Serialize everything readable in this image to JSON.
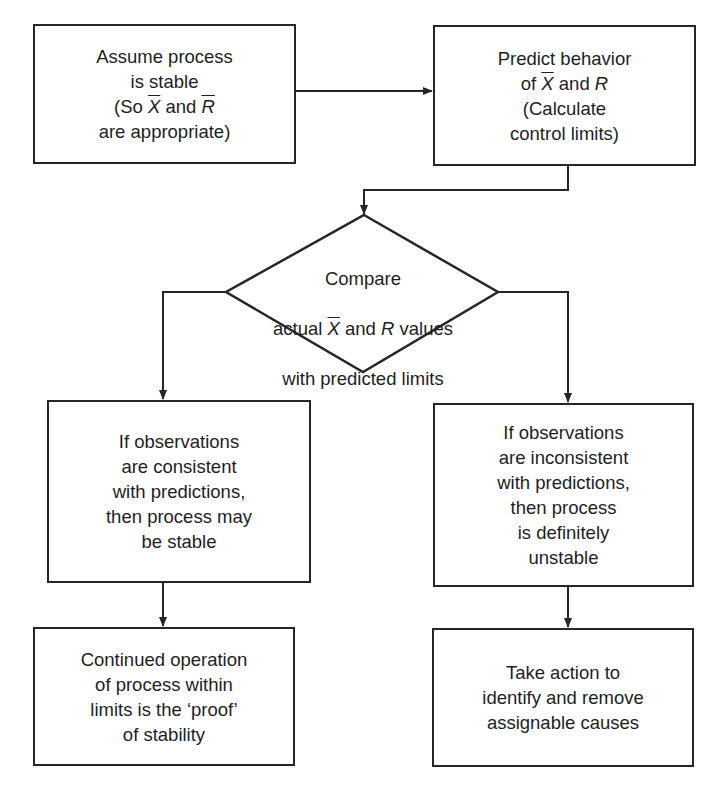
{
  "diagram": {
    "type": "flowchart",
    "title": "",
    "nodes": [
      {
        "id": "n1",
        "shape": "rect",
        "lines": [
          "Assume process",
          "is stable",
          "(So X̅ and R̅",
          "are appropriate)"
        ]
      },
      {
        "id": "n2",
        "shape": "rect",
        "lines": [
          "Predict behavior",
          "of X̅ and R",
          "(Calculate",
          "control limits)"
        ]
      },
      {
        "id": "n3",
        "shape": "diamond",
        "lines": [
          "Compare",
          "actual X̅ and R values",
          "with predicted limits"
        ]
      },
      {
        "id": "n4",
        "shape": "rect",
        "lines": [
          "If observations",
          "are consistent",
          "with predictions,",
          "then process may",
          "be stable"
        ]
      },
      {
        "id": "n5",
        "shape": "rect",
        "lines": [
          "If observations",
          "are inconsistent",
          "with predictions,",
          "then process",
          "is definitely",
          "unstable"
        ]
      },
      {
        "id": "n6",
        "shape": "rect",
        "lines": [
          "Continued operation",
          "of process within",
          "limits is the ‘proof’",
          "of stability"
        ]
      },
      {
        "id": "n7",
        "shape": "rect",
        "lines": [
          "Take action to",
          "identify and remove",
          "assignable causes"
        ]
      }
    ],
    "edges": [
      {
        "from": "n1",
        "to": "n2"
      },
      {
        "from": "n2",
        "to": "n3"
      },
      {
        "from": "n3",
        "to": "n4"
      },
      {
        "from": "n3",
        "to": "n5"
      },
      {
        "from": "n4",
        "to": "n6"
      },
      {
        "from": "n5",
        "to": "n7"
      }
    ],
    "colors": {
      "stroke": "#262626",
      "text": "#1e1e1e",
      "background": "#ffffff"
    }
  },
  "text": {
    "n1": {
      "l1": "Assume process",
      "l2": "is stable",
      "l3a": "(So ",
      "l3x": "X",
      "l3b": " and ",
      "l3r": "R",
      "l3c": "",
      "l4": "are appropriate)"
    },
    "n2": {
      "l1": "Predict behavior",
      "l2a": "of ",
      "l2x": "X",
      "l2b": " and ",
      "l2r": "R",
      "l3": "(Calculate",
      "l4": "control limits)"
    },
    "n3": {
      "l1": "Compare",
      "l2a": "actual ",
      "l2x": "X",
      "l2b": " and ",
      "l2r": "R",
      "l2c": " values",
      "l3": "with predicted limits"
    },
    "n4": {
      "label": "If observations\nare consistent\nwith predictions,\nthen process may\nbe stable"
    },
    "n5": {
      "label": "If observations\nare inconsistent\nwith predictions,\nthen process\nis definitely\nunstable"
    },
    "n6": {
      "label": "Continued operation\nof process within\nlimits is the ‘proof’\nof stability"
    },
    "n7": {
      "label": "Take action to\nidentify and remove\nassignable causes"
    }
  }
}
